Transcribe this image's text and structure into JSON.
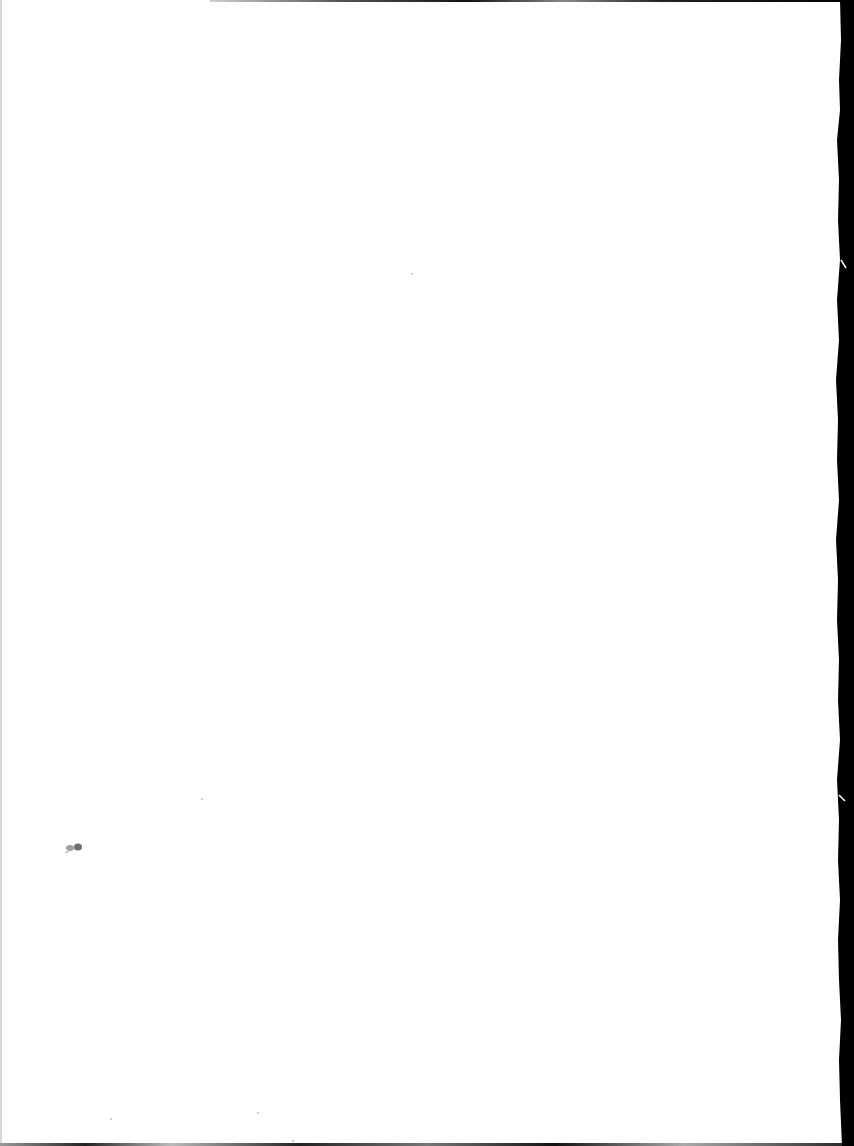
{
  "document": {
    "type": "scanned-page",
    "content": "",
    "colors": {
      "paper": "#ffffff",
      "scan_border": "#000000",
      "smudge": "#8a8a8a"
    }
  }
}
